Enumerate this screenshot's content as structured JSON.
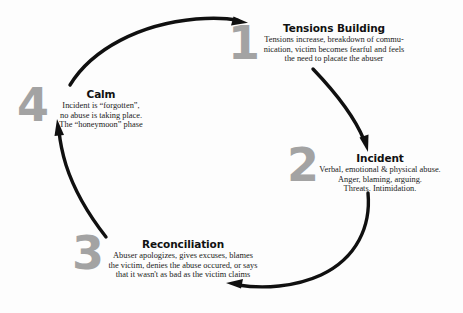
{
  "diagram": {
    "type": "cycle",
    "colors": {
      "arrow": "#101010",
      "number": "#a3a3a3",
      "heading": "#111111",
      "body": "#1a1a1a",
      "background": "#fdfdfd"
    },
    "stages": [
      {
        "number": "1",
        "title": "Tensions Building",
        "lines": [
          "Tensions increase, breakdown of commu-",
          "nication, victim becomes fearful and feels",
          "the need to placate the abuser"
        ]
      },
      {
        "number": "2",
        "title": "Incident",
        "lines": [
          "Verbal, emotional & physical abuse.",
          "Anger, blaming, arguing.",
          "Threats.  Intimidation."
        ]
      },
      {
        "number": "3",
        "title": "Reconciliation",
        "lines": [
          "Abuser apologizes, gives excuses, blames",
          "the victim, denies the abuse occured, or says",
          "that it wasn't as bad as the victim claims"
        ]
      },
      {
        "number": "4",
        "title": "Calm",
        "lines": [
          "Incident is “forgotten”,",
          "no abuse is taking place.",
          "The “honeymoon” phase"
        ]
      }
    ],
    "arrows": [
      {
        "name": "arrow-to-tensions-building",
        "from": "Calm",
        "to": "Tensions Building"
      },
      {
        "name": "arrow-to-incident",
        "from": "Tensions Building",
        "to": "Incident"
      },
      {
        "name": "arrow-to-reconciliation",
        "from": "Incident",
        "to": "Reconciliation"
      },
      {
        "name": "arrow-to-calm",
        "from": "Reconciliation",
        "to": "Calm"
      }
    ]
  }
}
